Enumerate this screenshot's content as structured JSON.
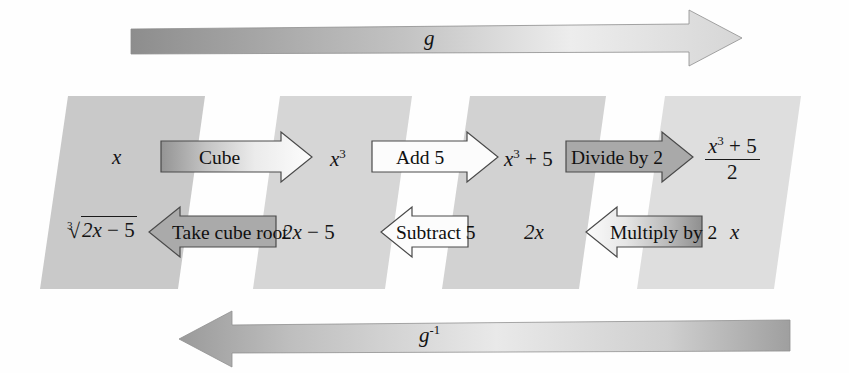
{
  "diagram": {
    "top_arrow": {
      "label": "g",
      "direction": "right"
    },
    "bottom_arrow": {
      "label": "g",
      "exponent": "-1",
      "direction": "left"
    },
    "forward_row": {
      "values": [
        {
          "id": "val-x",
          "text": "x",
          "style": "italic"
        },
        {
          "id": "val-x3",
          "text": "x³",
          "base": "x",
          "exponent": "3"
        },
        {
          "id": "val-x3p5",
          "text": "x³ + 5",
          "base": "x",
          "exponent": "3",
          "tail": " + 5"
        },
        {
          "id": "val-frac",
          "numerator": "x³ + 5",
          "denominator": "2"
        }
      ],
      "steps": [
        {
          "id": "step-cube",
          "label": "Cube",
          "fill": "gradient-dark",
          "direction": "right"
        },
        {
          "id": "step-add5",
          "label": "Add 5",
          "fill": "white",
          "direction": "right"
        },
        {
          "id": "step-divide2",
          "label": "Divide by 2",
          "fill": "gray",
          "direction": "right"
        }
      ]
    },
    "inverse_row": {
      "values": [
        {
          "id": "val-cuberoot",
          "index": "3",
          "radicand": "2x − 5"
        },
        {
          "id": "val-2xm5",
          "text": "2x − 5"
        },
        {
          "id": "val-2x",
          "text": "2x"
        },
        {
          "id": "val-x-final",
          "text": "x",
          "style": "italic"
        }
      ],
      "steps": [
        {
          "id": "step-take-cube-root",
          "label": "Take cube root",
          "fill": "gray",
          "direction": "left"
        },
        {
          "id": "step-subtract5",
          "label": "Subtract 5",
          "fill": "white",
          "direction": "left"
        },
        {
          "id": "step-multiply2",
          "label": "Multiply by 2",
          "fill": "gradient-dark",
          "direction": "left"
        }
      ]
    },
    "panels": [
      {
        "id": "panel-1",
        "shade": "#c9c9c9"
      },
      {
        "id": "panel-2",
        "shade": "#d6d6d6"
      },
      {
        "id": "panel-3",
        "shade": "#d2d2d2"
      },
      {
        "id": "panel-4",
        "shade": "#dedede"
      }
    ],
    "colors": {
      "panel_dark": "#c9c9c9",
      "panel_light": "#dedede",
      "arrow_gray": "#a8a8a8",
      "arrow_white": "#fbfbfb",
      "stroke": "#3a3a3a",
      "text": "#151515",
      "band_dark": "#8e8e8e",
      "band_light": "#f2f2f2"
    }
  }
}
